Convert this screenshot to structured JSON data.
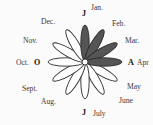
{
  "diagram": {
    "type": "seasonal-flower",
    "center": [
      85,
      62
    ],
    "petal_length": 36,
    "petal_width": 4.2,
    "shaded_color": "#555555",
    "unshaded_color": "#ffffff",
    "outline_color": "#2a2a2a",
    "petals": [
      {
        "month": "Jan.",
        "angle": -90,
        "shaded": true
      },
      {
        "month": "Feb.",
        "angle": -60,
        "shaded": true
      },
      {
        "month": "Mar.",
        "angle": -30,
        "shaded": true
      },
      {
        "month": "Apr.",
        "angle": 0,
        "shaded": true
      },
      {
        "month": "May",
        "angle": 30,
        "shaded": false
      },
      {
        "month": "June",
        "angle": 60,
        "shaded": false
      },
      {
        "month": "July",
        "angle": 90,
        "shaded": false
      },
      {
        "month": "Aug.",
        "angle": 120,
        "shaded": false
      },
      {
        "month": "Sept.",
        "angle": 150,
        "shaded": false
      },
      {
        "month": "Oct.",
        "angle": 180,
        "shaded": false
      },
      {
        "month": "Nov.",
        "angle": 210,
        "shaded": false
      },
      {
        "month": "Dec.",
        "angle": 240,
        "shaded": false
      }
    ]
  },
  "labels": {
    "jan": "Jan.",
    "feb": "Feb.",
    "mar": "Mar.",
    "apr": "Apr",
    "may": "May",
    "june": "June",
    "july": "July",
    "aug": "Aug.",
    "sept": "Sept.",
    "oct": "Oct.",
    "nov": "Nov.",
    "dec": "Dec."
  },
  "markers": {
    "top": "J",
    "right": "A",
    "bottom": "J",
    "left": "O"
  }
}
